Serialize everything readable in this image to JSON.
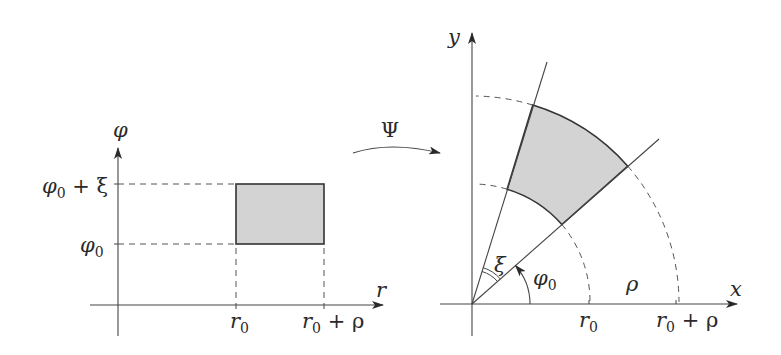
{
  "figure": {
    "type": "coordinate-transformation-diagram",
    "colors": {
      "line": "#3a3a3a",
      "dashed": "#555555",
      "fill": "#d3d3d3",
      "background": "#ffffff"
    }
  },
  "left_panel": {
    "axis_labels": {
      "vertical": "φ",
      "horizontal": "r"
    },
    "y_ticks": [
      {
        "label_main": "φ",
        "label_sub": "0",
        "label_rest": " + ξ"
      },
      {
        "label_main": "φ",
        "label_sub": "0",
        "label_rest": ""
      }
    ],
    "x_ticks": [
      {
        "label_main": "r",
        "label_sub": "0",
        "label_rest": ""
      },
      {
        "label_main": "r",
        "label_sub": "0",
        "label_rest": " + ρ"
      }
    ],
    "shape": "rectangle [r0, r0+ρ] × [φ0, φ0+ξ]"
  },
  "mapping": {
    "label": "Ψ"
  },
  "right_panel": {
    "axis_labels": {
      "vertical": "y",
      "horizontal": "x"
    },
    "x_ticks": [
      {
        "label_main": "r",
        "label_sub": "0",
        "label_rest": ""
      },
      {
        "label_main": "r",
        "label_sub": "0",
        "label_rest": " + ρ"
      }
    ],
    "angle_labels": {
      "phi0_main": "φ",
      "phi0_sub": "0",
      "xi": "ξ"
    },
    "radial_width_label": "ρ",
    "shape": "annular sector r∈[r0, r0+ρ], θ∈[φ0, φ0+ξ]"
  }
}
